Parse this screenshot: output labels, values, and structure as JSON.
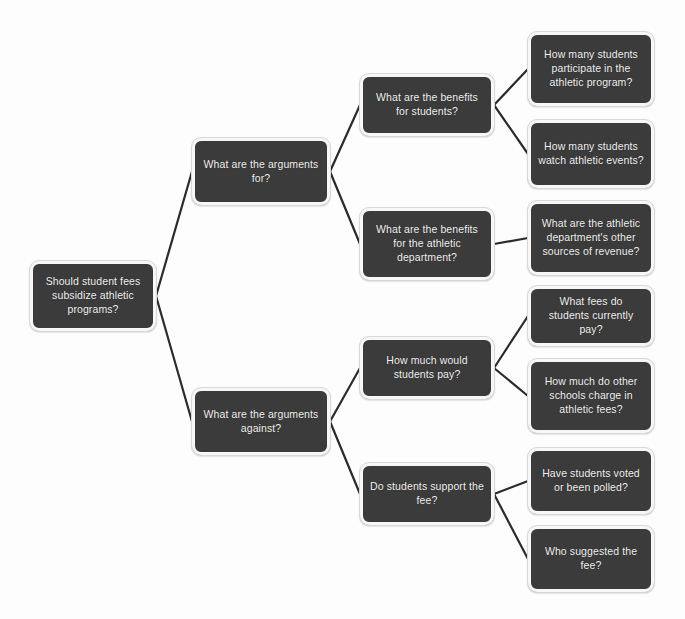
{
  "diagram": {
    "type": "question-tree",
    "title": "Should student fees subsidize athletic programs?",
    "background_color": "#fdfdfd",
    "node_fill_color": "#3b3b3b",
    "node_text_color": "#f2f2f2",
    "node_border_color": "#f7f7f7",
    "edge_color": "#2b2b2b",
    "nodes": [
      {
        "id": "root",
        "label": "Should student fees subsidize athletic programs?",
        "level": 0,
        "x": 30,
        "y": 261,
        "w": 126,
        "h": 70
      },
      {
        "id": "args-for",
        "label": "What are the arguments for?",
        "level": 1,
        "x": 192,
        "y": 138,
        "w": 138,
        "h": 67
      },
      {
        "id": "args-against",
        "label": "What are the arguments against?",
        "level": 1,
        "x": 192,
        "y": 388,
        "w": 138,
        "h": 67
      },
      {
        "id": "benefits-students",
        "label": "What are the benefits for students?",
        "level": 2,
        "x": 360,
        "y": 74,
        "w": 134,
        "h": 62
      },
      {
        "id": "benefits-department",
        "label": "What are the benefits for the athletic department?",
        "level": 2,
        "x": 360,
        "y": 208,
        "w": 134,
        "h": 72
      },
      {
        "id": "how-much-pay",
        "label": "How much would students pay?",
        "level": 2,
        "x": 360,
        "y": 337,
        "w": 134,
        "h": 62
      },
      {
        "id": "support-fee",
        "label": "Do students support the fee?",
        "level": 2,
        "x": 360,
        "y": 463,
        "w": 134,
        "h": 62
      },
      {
        "id": "participate",
        "label": "How many students participate in the athletic program?",
        "level": 3,
        "x": 528,
        "y": 32,
        "w": 126,
        "h": 74
      },
      {
        "id": "watch-events",
        "label": "How many students watch athletic events?",
        "level": 3,
        "x": 528,
        "y": 120,
        "w": 126,
        "h": 68
      },
      {
        "id": "other-revenue",
        "label": "What are the athletic department's other sources of revenue?",
        "level": 3,
        "x": 528,
        "y": 201,
        "w": 126,
        "h": 74
      },
      {
        "id": "current-fees",
        "label": "What fees do students currently pay?",
        "level": 3,
        "x": 528,
        "y": 286,
        "w": 126,
        "h": 60
      },
      {
        "id": "other-schools",
        "label": "How much do other schools charge in athletic fees?",
        "level": 3,
        "x": 528,
        "y": 359,
        "w": 126,
        "h": 74
      },
      {
        "id": "voted-polled",
        "label": "Have students voted or been polled?",
        "level": 3,
        "x": 528,
        "y": 448,
        "w": 126,
        "h": 66
      },
      {
        "id": "who-suggested",
        "label": "Who suggested the fee?",
        "level": 3,
        "x": 528,
        "y": 526,
        "w": 126,
        "h": 66
      }
    ],
    "edges": [
      {
        "from": "root",
        "to": "args-for"
      },
      {
        "from": "root",
        "to": "args-against"
      },
      {
        "from": "args-for",
        "to": "benefits-students"
      },
      {
        "from": "args-for",
        "to": "benefits-department"
      },
      {
        "from": "args-against",
        "to": "how-much-pay"
      },
      {
        "from": "args-against",
        "to": "support-fee"
      },
      {
        "from": "benefits-students",
        "to": "participate"
      },
      {
        "from": "benefits-students",
        "to": "watch-events"
      },
      {
        "from": "benefits-department",
        "to": "other-revenue"
      },
      {
        "from": "how-much-pay",
        "to": "current-fees"
      },
      {
        "from": "how-much-pay",
        "to": "other-schools"
      },
      {
        "from": "support-fee",
        "to": "voted-polled"
      },
      {
        "from": "support-fee",
        "to": "who-suggested"
      }
    ]
  }
}
